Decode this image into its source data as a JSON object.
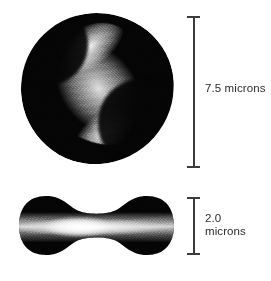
{
  "figure": {
    "background_color": "#ffffff",
    "ink_color": "#050505",
    "rule_color": "#3b3b3b",
    "label_color": "#2b2b2b"
  },
  "cells": [
    {
      "id": "top-view",
      "view": "face view",
      "description": "dark rounded erythrocyte seen face-on with a bright diagonal band"
    },
    {
      "id": "side-view",
      "view": "edge view",
      "description": "biconcave dumbbell profile of the erythrocyte with a bright horizontal band"
    }
  ],
  "scale_bars": [
    {
      "id": "diameter",
      "value": "7.5",
      "unit": "microns",
      "label": "7.5 microns",
      "measures": "top-view"
    },
    {
      "id": "thickness",
      "value": "2.0",
      "unit": "microns",
      "label": "2.0\nmicrons",
      "measures": "side-view"
    }
  ]
}
